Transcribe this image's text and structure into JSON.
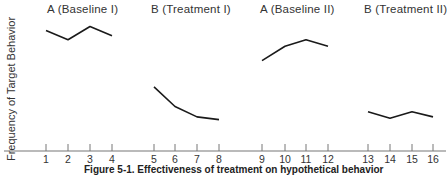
{
  "chart_data": {
    "type": "line",
    "title": "",
    "xlabel": "",
    "ylabel": "Frequency of Target Behavior",
    "x": [
      1,
      2,
      3,
      4,
      5,
      6,
      7,
      8,
      9,
      10,
      11,
      12,
      13,
      14,
      15,
      16
    ],
    "tick_labels": [
      "1",
      "2",
      "3",
      "4",
      "5",
      "6",
      "7",
      "8",
      "9",
      "10",
      "11",
      "12",
      "13",
      "14",
      "15",
      "16"
    ],
    "ylim": [
      0,
      10
    ],
    "y_ticks_shown": false,
    "grid": false,
    "legend": "none",
    "series": [
      {
        "name": "A (Baseline I)",
        "x": [
          1,
          2,
          3,
          4
        ],
        "values": [
          9.2,
          8.5,
          9.5,
          8.8
        ]
      },
      {
        "name": "B (Treatment I)",
        "x": [
          5,
          6,
          7,
          8
        ],
        "values": [
          4.9,
          3.4,
          2.6,
          2.4
        ]
      },
      {
        "name": "A (Baseline II)",
        "x": [
          9,
          10,
          11,
          12
        ],
        "values": [
          6.9,
          8.0,
          8.5,
          8.0
        ]
      },
      {
        "name": "B (Treatment II)",
        "x": [
          13,
          14,
          15,
          16
        ],
        "values": [
          3.0,
          2.5,
          3.0,
          2.6
        ]
      }
    ],
    "annotations": [
      "A (Baseline I)",
      "B (Treatment I)",
      "A (Baseline II)",
      "B (Treatment II)"
    ],
    "caption": "Figure 5-1. Effectiveness of treatment on hypothetical behavior"
  },
  "phases": [
    {
      "label": "A (Baseline I)",
      "left": 47
    },
    {
      "label": "B (Treatment I)",
      "left": 151
    },
    {
      "label": "A (Baseline II)",
      "left": 260
    },
    {
      "label": "B (Treatment II)",
      "left": 364
    }
  ],
  "tick_x_px": [
    46,
    68,
    90,
    112,
    154,
    175,
    197,
    219,
    262,
    285,
    306,
    328,
    368,
    390,
    412,
    433
  ],
  "axis_y_px": 151,
  "px_per_unit": 13.1,
  "line_color": "#1a1a1a",
  "axis_color": "#777777"
}
